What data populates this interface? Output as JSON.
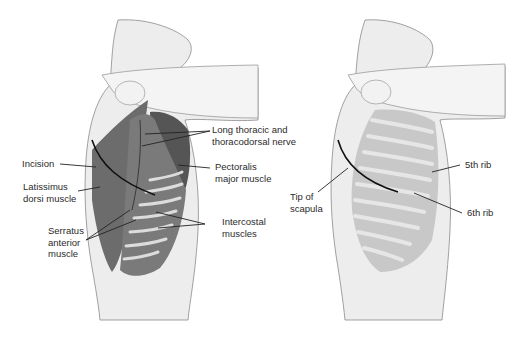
{
  "figure": {
    "type": "anatomical-illustration",
    "panels": [
      {
        "id": "left",
        "view": "lateral thorax, muscles exposed",
        "labels": [
          {
            "id": "incision",
            "lines": [
              "Incision"
            ]
          },
          {
            "id": "latissimus",
            "lines": [
              "Latissimus",
              "dorsi muscle"
            ]
          },
          {
            "id": "serratus",
            "lines": [
              "Serratus",
              "anterior",
              "muscle"
            ]
          },
          {
            "id": "long-thoracic",
            "lines": [
              "Long thoracic and",
              "thoracodorsal nerve"
            ]
          },
          {
            "id": "pectoralis",
            "lines": [
              "Pectoralis",
              "major muscle"
            ]
          },
          {
            "id": "intercostal",
            "lines": [
              "Intercostal",
              "muscles"
            ]
          }
        ]
      },
      {
        "id": "right",
        "view": "lateral thorax, ribs exposed",
        "labels": [
          {
            "id": "tip-scapula",
            "lines": [
              "Tip of",
              "scapula"
            ]
          },
          {
            "id": "rib5",
            "lines": [
              "5th rib"
            ]
          },
          {
            "id": "rib6",
            "lines": [
              "6th rib"
            ]
          }
        ]
      }
    ],
    "colors": {
      "skin": "#ececec",
      "outline": "#8a8a8a",
      "muscle": "#6e6e6e",
      "muscle_dark": "#5a5a5a",
      "rib": "#d6d6d6",
      "leader": "#222222",
      "text": "#2b2b2b"
    }
  }
}
